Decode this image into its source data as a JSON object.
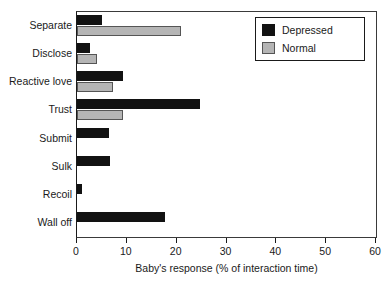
{
  "chart_data": {
    "type": "bar",
    "orientation": "horizontal",
    "title": "",
    "xlabel": "Baby's response (% of interaction time)",
    "ylabel": "",
    "xlim": [
      0,
      60
    ],
    "xticks": [
      0,
      10,
      20,
      30,
      40,
      50,
      60
    ],
    "grid": false,
    "legend_position": "top-right",
    "categories": [
      "Separate",
      "Disclose",
      "Reactive love",
      "Trust",
      "Submit",
      "Sulk",
      "Recoil",
      "Wall off"
    ],
    "series": [
      {
        "name": "Depressed",
        "color": "#121212",
        "values": [
          5.0,
          2.6,
          9.2,
          24.7,
          6.4,
          6.6,
          1.0,
          17.7
        ]
      },
      {
        "name": "Normal",
        "color": "#b5b5b5",
        "values": [
          20.9,
          4.0,
          7.2,
          9.2,
          0,
          0,
          0,
          0
        ]
      }
    ]
  },
  "legend": {
    "entries": [
      {
        "label": "Depressed",
        "swatch": "depressed"
      },
      {
        "label": "Normal",
        "swatch": "normal"
      }
    ]
  },
  "clipped_top_text": ""
}
